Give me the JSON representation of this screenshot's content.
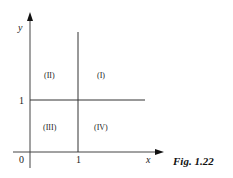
{
  "figure": {
    "caption": "Fig. 1.22",
    "axes": {
      "x_label": "x",
      "y_label": "y",
      "origin_label": "0",
      "x_tick_label": "1",
      "y_tick_label": "1"
    },
    "regions": [
      {
        "id": "I",
        "label": "(I)"
      },
      {
        "id": "II",
        "label": "(II)"
      },
      {
        "id": "III",
        "label": "(III)"
      },
      {
        "id": "IV",
        "label": "(IV)"
      }
    ],
    "lines": {
      "vertical": "x = 1",
      "horizontal": "y = 1"
    },
    "colors": {
      "line": "#333333",
      "background": "#ffffff"
    }
  }
}
